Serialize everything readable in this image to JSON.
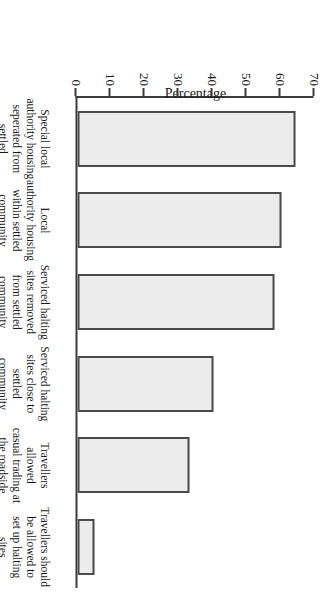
{
  "chart_data": {
    "type": "bar",
    "title": "",
    "xlabel": "",
    "ylabel": "Percentage",
    "ylim": [
      0,
      70
    ],
    "yticks": [
      0,
      10,
      20,
      30,
      40,
      50,
      60,
      70
    ],
    "ytick_labels": [
      "0",
      "10",
      "20",
      "30",
      "40",
      "50",
      "60",
      "70"
    ],
    "grid": false,
    "legend": false,
    "orientation": "vertical-bars-on-rotated-page",
    "categories": [
      "Special local authority housing seperated from settled community",
      "Local authority housing within settled community",
      "Serviced halting sites removed from settled community",
      "Serviced halting sites close to settled community",
      "Travellers allowed casual trading at the roadside",
      "Travellers should be allowed to set up halting sites wherever they wish"
    ],
    "category_lines": [
      [
        "Special local",
        "authority housing",
        "seperated from",
        "settled community"
      ],
      [
        "Local",
        "authority housing",
        "within settled",
        "community"
      ],
      [
        "Serviced halting",
        "sites removed",
        "from settled",
        "community"
      ],
      [
        "Serviced halting",
        "sites close to",
        "settled",
        "community"
      ],
      [
        "Travellers allowed",
        "casual trading at",
        "the roadside"
      ],
      [
        "Travellers should",
        "be allowed to",
        "set up halting sites",
        "wherever they wish"
      ]
    ],
    "values": [
      64,
      60,
      58,
      40,
      33,
      5
    ]
  },
  "style": {
    "bar_fill": "#ececec",
    "bar_border": "#4a4a4a",
    "axis_color": "#3b3b3b",
    "text_color": "#1a1a1a",
    "background": "#ffffff"
  }
}
